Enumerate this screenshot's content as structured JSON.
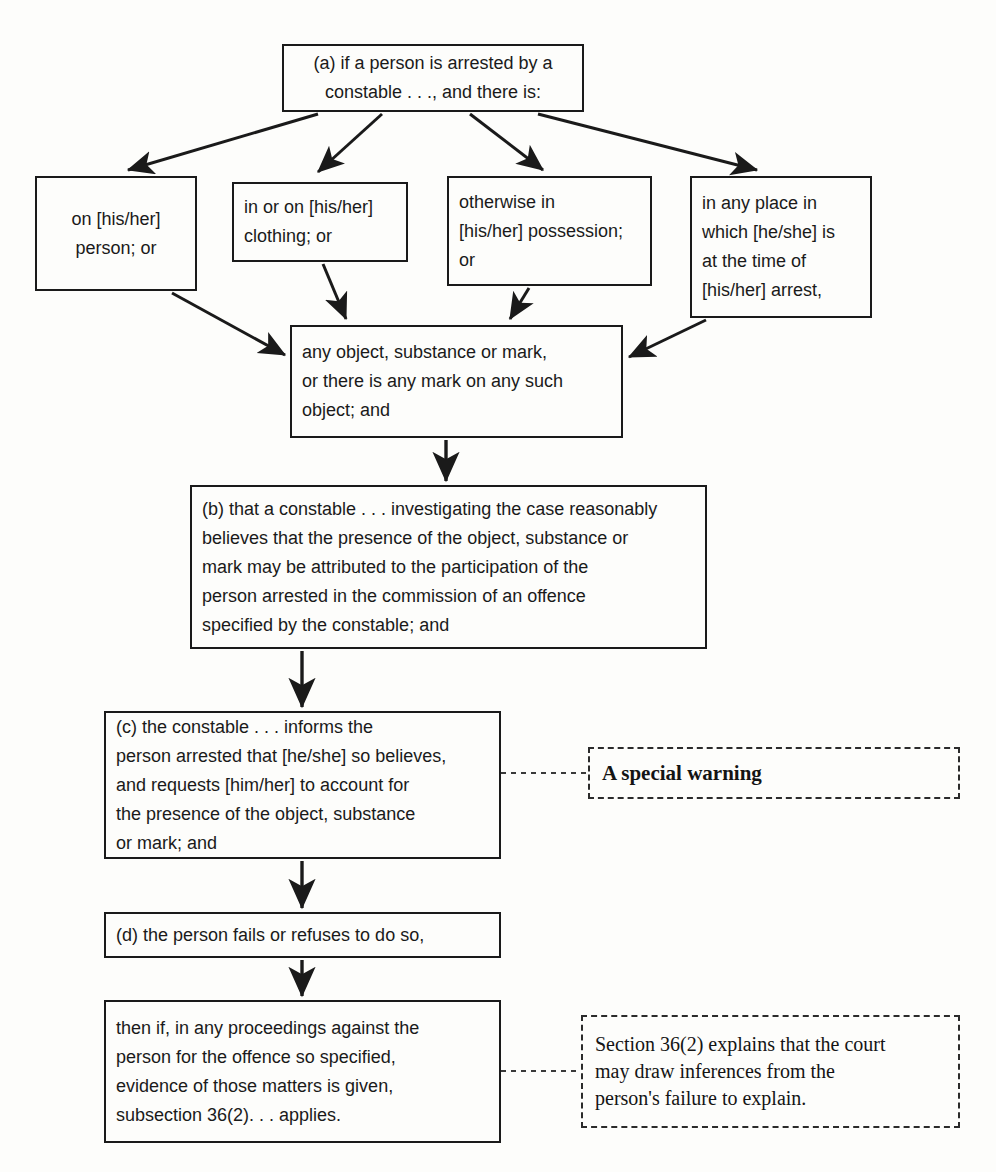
{
  "diagram": {
    "nodes": {
      "a": "(a) if a person is arrested by a\nconstable . . ., and there is:",
      "b1": "on [his/her]\nperson; or",
      "b2": "in or on [his/her]\nclothing; or",
      "b3": "otherwise in\n[his/her] possession;\nor",
      "b4": "in any place in\nwhich [he/she] is\nat the time of\n[his/her] arrest,",
      "c": "any object, substance or mark,\nor there is any mark on any such\nobject; and",
      "d": "(b) that a constable . . . investigating the case reasonably\nbelieves that the presence of the object, substance or\nmark may be attributed to the participation of the\nperson arrested in the commission of an offence\nspecified by the constable; and",
      "e": "(c) the constable . . . informs the\nperson arrested that [he/she] so believes,\nand requests [him/her] to account for\nthe presence of the object, substance\nor mark; and",
      "f": "(d) the person fails or refuses to do so,",
      "g": "then if, in any proceedings against the\nperson for the offence so specified,\nevidence of those matters is given,\nsubsection 36(2). . . applies."
    },
    "annotations": {
      "special_warning": "A special warning",
      "section_note": "Section 36(2) explains that the court\nmay draw inferences from the\nperson's failure to explain."
    },
    "colors": {
      "line": "#1a1a1a",
      "text": "#1a1a1a",
      "background": "#fdfdfb",
      "annotation_border": "#2b2b2b"
    }
  }
}
